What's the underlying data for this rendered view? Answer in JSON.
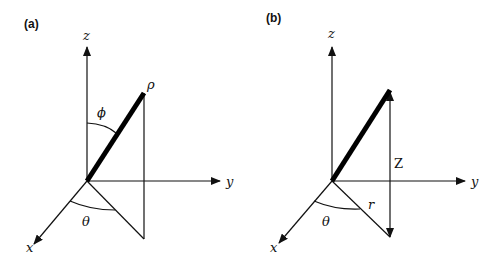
{
  "figure": {
    "type": "coordinate-system-diagram",
    "panels": [
      {
        "id": "a",
        "panel_label": "(a)",
        "system": "spherical",
        "axes": {
          "x": "x",
          "y": "y",
          "z": "z"
        },
        "labels": {
          "radius": "ρ",
          "polar_angle": "ϕ",
          "azimuth": "θ"
        }
      },
      {
        "id": "b",
        "panel_label": "(b)",
        "system": "cylindrical",
        "axes": {
          "x": "x",
          "y": "y",
          "z": "z"
        },
        "labels": {
          "height": "Z",
          "radius": "r",
          "azimuth": "θ"
        }
      }
    ]
  },
  "colors": {
    "ink": "#111111",
    "background": "#ffffff"
  }
}
